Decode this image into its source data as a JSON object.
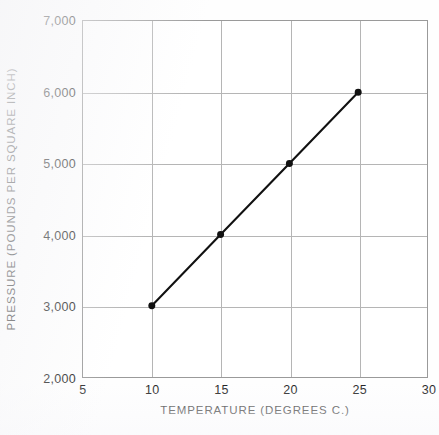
{
  "chart_data": {
    "type": "line",
    "title": "",
    "xlabel": "TEMPERATURE  (DEGREES  C.)",
    "ylabel": "PRESSURE  (POUNDS  PER  SQUARE  INCH)",
    "x": [
      10,
      15,
      20,
      25
    ],
    "values": [
      3000,
      4000,
      5000,
      6000
    ],
    "series": [
      {
        "name": "pressure",
        "x": [
          10,
          15,
          20,
          25
        ],
        "values": [
          3000,
          4000,
          5000,
          6000
        ]
      }
    ],
    "xlim": [
      5,
      30
    ],
    "ylim": [
      2000,
      7000
    ],
    "xticks": [
      5,
      10,
      15,
      20,
      25,
      30
    ],
    "yticks": [
      2000,
      3000,
      4000,
      5000,
      6000,
      7000
    ],
    "xtick_labels": [
      "5",
      "10",
      "15",
      "20",
      "25",
      "30"
    ],
    "ytick_labels": [
      "2,000",
      "3,000",
      "4,000",
      "5,000",
      "6,000",
      "7,000"
    ],
    "grid": true,
    "grid_x_values": [
      10,
      15,
      20,
      25
    ],
    "grid_y_values": [
      3000,
      4000,
      5000,
      6000
    ],
    "legend": null,
    "marker": "filled-circle",
    "line_color": "#111111",
    "grid_color": "#b5b5b5",
    "frame_color": "#9a9a9a",
    "background_color": "#ffffff"
  }
}
